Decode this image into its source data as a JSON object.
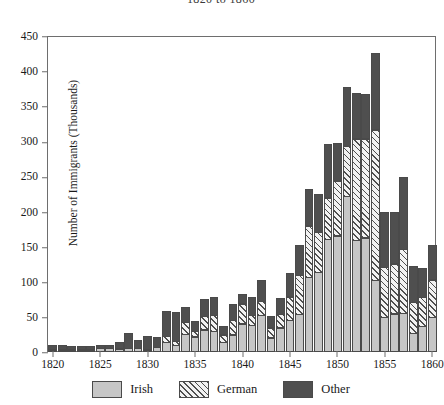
{
  "chart_data": {
    "type": "bar",
    "subtype": "stacked-bar",
    "title": "1820 to 1860",
    "xlabel": "",
    "ylabel": "Number of Immigrants (Thousands)",
    "ylim": [
      0,
      450
    ],
    "ytick_step": 50,
    "yticks": [
      "0",
      "50",
      "100",
      "150",
      "200",
      "250",
      "300",
      "350",
      "400",
      "450"
    ],
    "xlim": [
      1819.5,
      1860.5
    ],
    "xticks": [
      "1820",
      "1825",
      "1830",
      "1835",
      "1840",
      "1845",
      "1850",
      "1855",
      "1860"
    ],
    "grid": false,
    "legend_position": "bottom",
    "categories": [
      "1820",
      "1821",
      "1822",
      "1823",
      "1824",
      "1825",
      "1826",
      "1827",
      "1828",
      "1829",
      "1830",
      "1831",
      "1832",
      "1833",
      "1834",
      "1835",
      "1836",
      "1837",
      "1838",
      "1839",
      "1840",
      "1841",
      "1842",
      "1843",
      "1844",
      "1845",
      "1846",
      "1847",
      "1848",
      "1849",
      "1850",
      "1851",
      "1852",
      "1853",
      "1854",
      "1855",
      "1856",
      "1857",
      "1858",
      "1859",
      "1860"
    ],
    "series": [
      {
        "name": "Irish",
        "color": "#c6c6c6",
        "pattern": "solid",
        "values": [
          1,
          1,
          2,
          2,
          2,
          5,
          5,
          4,
          5,
          5,
          3,
          6,
          13,
          9,
          25,
          21,
          31,
          29,
          13,
          24,
          40,
          38,
          52,
          20,
          34,
          45,
          53,
          106,
          113,
          160,
          165,
          221,
          159,
          162,
          102,
          49,
          54,
          55,
          26,
          36,
          49
        ]
      },
      {
        "name": "German",
        "color": "#f2f2f2",
        "pattern": "diagonal-hatch",
        "values": [
          0,
          0,
          0,
          0,
          0,
          0,
          0,
          0,
          0,
          0,
          0,
          0,
          10,
          7,
          18,
          9,
          20,
          24,
          12,
          22,
          29,
          15,
          21,
          15,
          20,
          34,
          57,
          74,
          58,
          60,
          79,
          72,
          145,
          142,
          215,
          72,
          72,
          92,
          45,
          42,
          54
        ]
      },
      {
        "name": "Other",
        "color": "#4f4f4f",
        "pattern": "solid",
        "values": [
          7,
          7,
          6,
          6,
          6,
          5,
          5,
          10,
          22,
          13,
          20,
          16,
          37,
          42,
          22,
          15,
          25,
          26,
          13,
          23,
          15,
          27,
          31,
          17,
          24,
          35,
          44,
          54,
          55,
          77,
          55,
          86,
          66,
          64,
          110,
          79,
          74,
          104,
          52,
          43,
          50
        ]
      }
    ]
  },
  "legend": {
    "items": [
      {
        "label": "Irish",
        "swatch": "irish-swatch"
      },
      {
        "label": "German",
        "swatch": "german-swatch"
      },
      {
        "label": "Other",
        "swatch": "other-swatch"
      }
    ]
  }
}
